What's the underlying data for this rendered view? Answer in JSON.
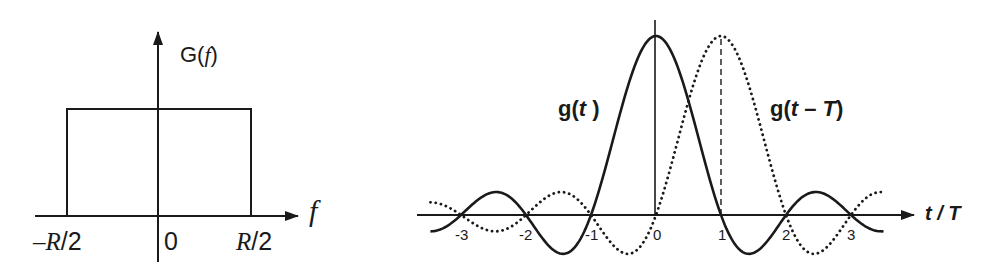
{
  "left_panel": {
    "title": "Rectangular spectrum G(f)",
    "y_axis_label_prefix": "G(",
    "y_axis_label_var": "f",
    "y_axis_label_suffix": ")",
    "x_axis_label": "f",
    "ticks": {
      "neg_prefix": "–",
      "neg_var": "R",
      "neg_suffix": "/2",
      "zero": "0",
      "pos_var": "R",
      "pos_suffix": "/2"
    }
  },
  "right_panel": {
    "curve1_label_prefix": "g(",
    "curve1_label_var": "t",
    "curve1_label_suffix": " )",
    "curve2_label_prefix": "g(",
    "curve2_label_var": "t",
    "curve2_label_mid": " – ",
    "curve2_label_var2": "T",
    "curve2_label_suffix": ")",
    "x_axis_label_var1": "t",
    "x_axis_label_sep": " / ",
    "x_axis_label_var2": "T",
    "tick_labels": [
      "-3",
      "-2",
      "-1",
      "0",
      "1",
      "2",
      "3"
    ]
  },
  "colors": {
    "ink": "#1a1a1a",
    "background": "#ffffff"
  },
  "chart_data": [
    {
      "type": "area",
      "title": "G(f)",
      "xlabel": "f",
      "ylabel": "G(f)",
      "categories": [
        "-R/2",
        "0",
        "R/2"
      ],
      "x": [
        -0.5,
        0.5
      ],
      "values": [
        1,
        1
      ],
      "description": "Ideal rectangular (brick-wall) spectrum: constant from -R/2 to R/2, zero elsewhere",
      "grid": false
    },
    {
      "type": "line",
      "title": "g(t) and g(t - T)",
      "xlabel": "t/T",
      "ylabel": "",
      "x_ticks": [
        -3,
        -2,
        -1,
        0,
        1,
        2,
        3
      ],
      "xlim": [
        -3.47,
        3.5
      ],
      "ylim": [
        -0.22,
        1.0
      ],
      "grid": false,
      "series": [
        {
          "name": "g(t)",
          "style": "solid",
          "formula": "sinc(t/T)",
          "shift": 0,
          "x": [
            -3,
            -2.5,
            -2,
            -1.5,
            -1,
            -0.5,
            0,
            0.5,
            1,
            1.5,
            2,
            2.5,
            3
          ],
          "values": [
            0,
            0.127,
            0,
            -0.212,
            0,
            0.637,
            1,
            0.637,
            0,
            -0.212,
            0,
            0.127,
            0
          ]
        },
        {
          "name": "g(t - T)",
          "style": "dotted",
          "formula": "sinc(t/T - 1)",
          "shift": 1,
          "x": [
            -3,
            -2.5,
            -2,
            -1.5,
            -1,
            -0.5,
            0,
            0.5,
            1,
            1.5,
            2,
            2.5,
            3
          ],
          "values": [
            0,
            -0.091,
            0,
            0.127,
            0,
            -0.212,
            0,
            0.637,
            1,
            0.637,
            0,
            -0.212,
            0
          ]
        }
      ],
      "annotations": [
        "dashed vertical line at t/T = 1 from axis to peak of g(t - T)"
      ]
    }
  ]
}
